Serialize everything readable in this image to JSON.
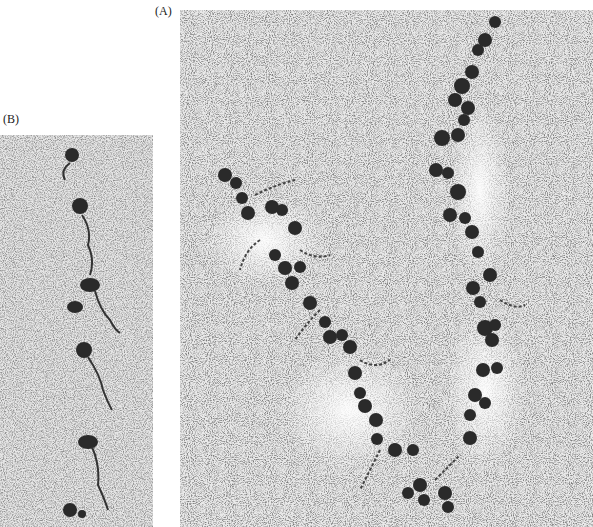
{
  "figure": {
    "panels": [
      {
        "id": "A",
        "label": "(A)",
        "description": "Electron micrograph of chromatin fibers showing nucleosome clusters along two strands on a stippled background"
      },
      {
        "id": "B",
        "label": "(B)",
        "description": "Electron micrograph of a single chromatin strand with spaced nucleosome beads and linker DNA"
      }
    ]
  },
  "colors": {
    "background": "#ffffff",
    "grain_light": "#d8d8d8",
    "grain_dark": "#3a3a3a",
    "nucleosome": "#2a2a2a"
  }
}
